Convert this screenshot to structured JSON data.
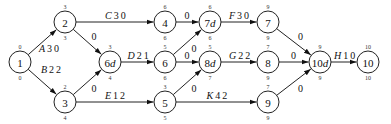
{
  "diagram": {
    "type": "activity-on-arrow network",
    "nodes": [
      {
        "id": "n1",
        "label": "1",
        "top": "0",
        "bottom": "0",
        "x": 20,
        "y": 62
      },
      {
        "id": "n2",
        "label": "2",
        "top": "3",
        "bottom": "3",
        "x": 65,
        "y": 22
      },
      {
        "id": "n3",
        "label": "3",
        "top": "2",
        "bottom": "4",
        "x": 65,
        "y": 102
      },
      {
        "id": "n6d",
        "label": "6d",
        "top": "3",
        "bottom": "4",
        "x": 110,
        "y": 62
      },
      {
        "id": "n4",
        "label": "4",
        "top": "6",
        "bottom": "6",
        "x": 165,
        "y": 22
      },
      {
        "id": "n6",
        "label": "6",
        "top": "5",
        "bottom": "6",
        "x": 165,
        "y": 62
      },
      {
        "id": "n5",
        "label": "5",
        "top": "3",
        "bottom": "5",
        "x": 165,
        "y": 102
      },
      {
        "id": "n7d",
        "label": "7d",
        "top": "6",
        "bottom": "6",
        "x": 210,
        "y": 22
      },
      {
        "id": "n8d",
        "label": "8d",
        "top": "5",
        "bottom": "7",
        "x": 210,
        "y": 62
      },
      {
        "id": "n7",
        "label": "7",
        "top": "9",
        "bottom": "9",
        "x": 268,
        "y": 22
      },
      {
        "id": "n8",
        "label": "8",
        "top": "7",
        "bottom": "9",
        "x": 268,
        "y": 62
      },
      {
        "id": "n9",
        "label": "9",
        "top": "7",
        "bottom": "9",
        "x": 268,
        "y": 102
      },
      {
        "id": "n10d",
        "label": "10d",
        "top": "9",
        "bottom": "9",
        "x": 320,
        "y": 62
      },
      {
        "id": "n10",
        "label": "10",
        "top": "10",
        "bottom": "10",
        "x": 368,
        "y": 62
      }
    ],
    "edges": [
      {
        "from": "n1",
        "to": "n2",
        "name": "A",
        "value": "3 0"
      },
      {
        "from": "n1",
        "to": "n3",
        "name": "B",
        "value": "2 2"
      },
      {
        "from": "n2",
        "to": "n4",
        "name": "C",
        "value": "3 0"
      },
      {
        "from": "n2",
        "to": "n6d",
        "name": "",
        "value": "0"
      },
      {
        "from": "n3",
        "to": "n6d",
        "name": "",
        "value": "0"
      },
      {
        "from": "n3",
        "to": "n5",
        "name": "E",
        "value": "1 2"
      },
      {
        "from": "n6d",
        "to": "n6",
        "name": "D",
        "value": "2 1"
      },
      {
        "from": "n4",
        "to": "n7d",
        "name": "",
        "value": "0"
      },
      {
        "from": "n6",
        "to": "n7d",
        "name": "",
        "value": "0"
      },
      {
        "from": "n6",
        "to": "n8d",
        "name": "",
        "value": "0"
      },
      {
        "from": "n5",
        "to": "n8d",
        "name": "",
        "value": "0"
      },
      {
        "from": "n5",
        "to": "n9",
        "name": "K",
        "value": "4 2"
      },
      {
        "from": "n7d",
        "to": "n7",
        "name": "F",
        "value": "3 0"
      },
      {
        "from": "n8d",
        "to": "n8",
        "name": "G",
        "value": "2 2"
      },
      {
        "from": "n7",
        "to": "n10d",
        "name": "",
        "value": "0"
      },
      {
        "from": "n8",
        "to": "n10d",
        "name": "",
        "value": "0"
      },
      {
        "from": "n9",
        "to": "n10d",
        "name": "",
        "value": "0"
      },
      {
        "from": "n10d",
        "to": "n10",
        "name": "H",
        "value": "1 0"
      }
    ]
  }
}
